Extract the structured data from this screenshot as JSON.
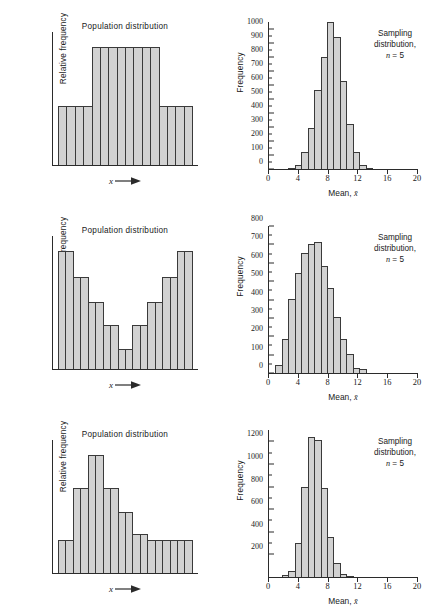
{
  "figure": {
    "population_title": "Population distribution",
    "population_ylabel": "Relative frequency",
    "population_xlabel": "x",
    "sampling_ylabel": "Frequency",
    "sampling_xlabel_prefix": "Mean, ",
    "sampling_xlabel_symbol": "x̄",
    "note_line1": "Sampling",
    "note_line2": "distribution,",
    "note_line3_var": "n",
    "note_line3_rest": " = 5",
    "bar_fill": "#d2d2d2",
    "bar_stroke": "#3a3a3a",
    "axis_color": "#2b2b2b"
  },
  "chart_data": [
    {
      "type": "bar",
      "id": "population-1",
      "title": "Population distribution",
      "xlabel": "x",
      "ylabel": "Relative frequency",
      "description": "Symmetric plateau (mound) population distribution",
      "categories": [
        "1",
        "2",
        "3",
        "4",
        "5",
        "6",
        "7",
        "8",
        "9",
        "10",
        "11",
        "12",
        "13",
        "14",
        "15",
        "16"
      ],
      "values": [
        50,
        50,
        50,
        50,
        100,
        100,
        100,
        100,
        100,
        100,
        100,
        100,
        50,
        50,
        50,
        50
      ],
      "ylim": [
        0,
        100
      ],
      "grid": false,
      "legend": "none"
    },
    {
      "type": "bar",
      "id": "sampling-1",
      "title": "Sampling distribution, n = 5",
      "xlabel": "Mean, x̄",
      "ylabel": "Frequency",
      "x": [
        1,
        2,
        3,
        4,
        5,
        6,
        7,
        8,
        9,
        10,
        11,
        12,
        13,
        14,
        15,
        16,
        17,
        18,
        19,
        20
      ],
      "values": [
        0,
        0,
        0,
        5,
        30,
        120,
        295,
        565,
        800,
        1050,
        945,
        630,
        325,
        118,
        28,
        10,
        0,
        0,
        0,
        0
      ],
      "ylim": [
        0,
        1050
      ],
      "yticks": [
        0,
        100,
        200,
        300,
        400,
        500,
        600,
        700,
        800,
        900,
        1000
      ],
      "xticks": [
        0,
        4,
        8,
        12,
        16,
        20
      ],
      "grid": false,
      "legend": "none"
    },
    {
      "type": "bar",
      "id": "population-2",
      "title": "Population distribution",
      "xlabel": "x",
      "ylabel": "Relative frequency",
      "description": "U-shaped (bimodal at extremes) population distribution",
      "categories": [
        "1",
        "2",
        "3",
        "4",
        "5",
        "6",
        "7",
        "8",
        "9",
        "10",
        "11",
        "12",
        "13",
        "14",
        "15",
        "16"
      ],
      "values": [
        100,
        100,
        78,
        78,
        57,
        57,
        37,
        37,
        17,
        17,
        37,
        37,
        57,
        57,
        78,
        78,
        100,
        100
      ],
      "ylim": [
        0,
        100
      ],
      "grid": false,
      "legend": "none"
    },
    {
      "type": "bar",
      "id": "sampling-2",
      "title": "Sampling distribution, n = 5",
      "xlabel": "Mean, x̄",
      "ylabel": "Frequency",
      "x": [
        1,
        2,
        3,
        4,
        5,
        6,
        7,
        8,
        9,
        10,
        11,
        12,
        13,
        14,
        15,
        16,
        17,
        18,
        19,
        20
      ],
      "values": [
        0,
        45,
        185,
        405,
        545,
        655,
        700,
        715,
        585,
        460,
        305,
        185,
        105,
        28,
        20,
        0,
        0,
        0,
        0,
        0
      ],
      "ylim": [
        0,
        800
      ],
      "yticks": [
        0,
        100,
        200,
        300,
        400,
        500,
        600,
        700,
        800
      ],
      "xticks": [
        0,
        4,
        8,
        12,
        16,
        20
      ],
      "grid": false,
      "legend": "none"
    },
    {
      "type": "bar",
      "id": "population-3",
      "title": "Population distribution",
      "xlabel": "x",
      "ylabel": "Relative frequency",
      "description": "Right-skewed population distribution with long flat tail",
      "categories": [
        "1",
        "2",
        "3",
        "4",
        "5",
        "6",
        "7",
        "8",
        "9",
        "10",
        "11",
        "12",
        "13",
        "14",
        "15",
        "16"
      ],
      "values": [
        28,
        28,
        72,
        72,
        100,
        100,
        72,
        72,
        52,
        52,
        33,
        33,
        28,
        28,
        28,
        28,
        28,
        28
      ],
      "ylim": [
        0,
        100
      ],
      "grid": false,
      "legend": "none"
    },
    {
      "type": "bar",
      "id": "sampling-3",
      "title": "Sampling distribution, n = 5",
      "xlabel": "Mean, x̄",
      "ylabel": "Frequency",
      "x": [
        1,
        2,
        3,
        4,
        5,
        6,
        7,
        8,
        9,
        10,
        11,
        12,
        13,
        14,
        15,
        16,
        17,
        18,
        19,
        20
      ],
      "values": [
        0,
        0,
        20,
        55,
        305,
        800,
        1240,
        1210,
        790,
        350,
        120,
        30,
        8,
        0,
        0,
        0,
        0,
        0,
        0,
        0
      ],
      "ylim": [
        0,
        1300
      ],
      "yticks": [
        200,
        400,
        600,
        800,
        1000,
        1200
      ],
      "xticks": [
        0,
        4,
        8,
        12,
        16,
        20
      ],
      "grid": false,
      "legend": "none"
    }
  ]
}
